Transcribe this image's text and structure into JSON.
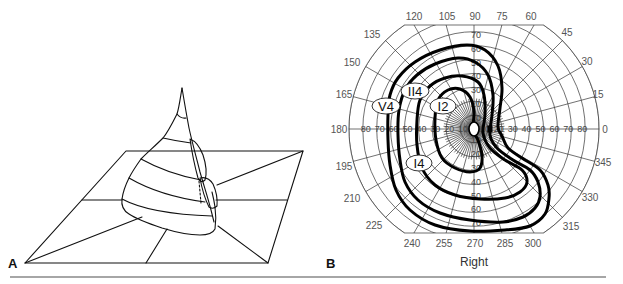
{
  "panels": {
    "a": {
      "letter": "A",
      "letter_pos": [
        8,
        268
      ]
    },
    "b": {
      "letter": "B",
      "letter_pos": [
        326,
        268
      ],
      "eye_label": "Right",
      "eye_label_pos": [
        474,
        266
      ]
    }
  },
  "colors": {
    "line": "#111111",
    "grid": "#333333",
    "label": "#555555",
    "divider": "#888888",
    "background": "#ffffff"
  },
  "divider": {
    "x1": 10,
    "x2": 606,
    "y": 277
  },
  "figure_a": {
    "description": "3D hill of vision over a field plane",
    "plane_outline": [
      [
        25,
        263
      ],
      [
        268,
        263
      ],
      [
        303,
        151
      ],
      [
        126,
        151
      ],
      [
        25,
        263
      ]
    ],
    "plane_lines": [
      [
        [
          146,
          263
        ],
        [
          167,
          229
        ]
      ],
      [
        [
          82,
          200
        ],
        [
          122,
          200
        ]
      ],
      [
        [
          216,
          200
        ],
        [
          287,
          200
        ]
      ],
      [
        [
          25,
          263
        ],
        [
          142,
          217
        ]
      ],
      [
        [
          303,
          151
        ],
        [
          217,
          185
        ]
      ],
      [
        [
          268,
          263
        ],
        [
          218,
          226
        ]
      ]
    ],
    "hill_outline": "M182,88 C180,100 179,108 177,114 C172,124 168,132 163,138 C155,146 148,152 141,159 C136,166 132,172 129,178 C125,186 123,192 122,199 C121,206 124,211 129,214 C138,220 150,224 162,228 C175,232 188,235 200,235 C208,235 213,233 215,229 C216,222 216,214 215,207 C214,200 213,196 212,192",
    "hill_ridge": "M182,88 C184,100 186,112 189,128 C192,142 196,156 200,172 C204,186 208,198 211,210 C212,214 213,218 214,222",
    "hill_bands": [
      "M177,114 Q181,119 186,118",
      "M163,138 Q176,141 191,143",
      "M141,159 Q168,174 201,180",
      "M129,178 Q160,196 205,202",
      "M122,199 Q150,214 212,216"
    ],
    "hill_lobes": [
      "M190,139 Q198,142 203,155 Q208,170 205,180 Q201,184 198,178 Q193,160 190,139",
      "M200,178 Q208,176 213,184 Q218,195 217,206 Q213,210 209,207 Q203,195 200,178"
    ],
    "hill_dashed": "M199,181 L201,203"
  },
  "chart_data": {
    "type": "polar",
    "subtitle": "Right",
    "angular_ticks_deg": [
      0,
      15,
      30,
      45,
      60,
      75,
      90,
      105,
      120,
      135,
      150,
      165,
      180,
      195,
      210,
      225,
      240,
      255,
      270,
      285,
      300,
      315,
      330,
      345
    ],
    "radial_ticks_deg": [
      10,
      20,
      30,
      40,
      50,
      60,
      70,
      80,
      90
    ],
    "radial_tick_labels": [
      "10",
      "20",
      "30",
      "40",
      "50",
      "60",
      "70",
      "80"
    ],
    "radial_range": [
      0,
      90
    ],
    "grid": true,
    "isopters": [
      {
        "name": "V4",
        "extent_deg": {
          "0": 17,
          "90": 61,
          "180": 64,
          "270": 74,
          "315": 74
        }
      },
      {
        "name": "II4",
        "extent_deg": {
          "0": 11,
          "90": 52,
          "180": 56,
          "270": 68,
          "315": 65
        }
      },
      {
        "name": "I4",
        "extent_deg": {
          "0": 6,
          "90": 39,
          "180": 42,
          "270": 51,
          "315": 50
        }
      },
      {
        "name": "I2",
        "extent_deg": {
          "0": 1,
          "90": 29,
          "180": 29,
          "270": 31,
          "315": 25
        }
      }
    ],
    "blind_spot": {
      "angle_deg": 0,
      "eccentricity_deg": 12
    }
  },
  "figure_b": {
    "center": [
      474,
      129
    ],
    "px_per_10deg": 13.9,
    "clip_top_y": 25,
    "clip_bottom_y": 233,
    "angle_labels": [
      {
        "t": "0",
        "x": 605,
        "y": 133
      },
      {
        "t": "15",
        "x": 598,
        "y": 98
      },
      {
        "t": "30",
        "x": 587,
        "y": 65
      },
      {
        "t": "45",
        "x": 567,
        "y": 36
      },
      {
        "t": "60",
        "x": 531,
        "y": 20
      },
      {
        "t": "75",
        "x": 502,
        "y": 20
      },
      {
        "t": "90",
        "x": 475,
        "y": 20
      },
      {
        "t": "105",
        "x": 447,
        "y": 20
      },
      {
        "t": "120",
        "x": 414,
        "y": 20
      },
      {
        "t": "135",
        "x": 372,
        "y": 38
      },
      {
        "t": "150",
        "x": 352,
        "y": 66
      },
      {
        "t": "165",
        "x": 344,
        "y": 98
      },
      {
        "t": "180",
        "x": 339,
        "y": 133
      },
      {
        "t": "195",
        "x": 344,
        "y": 170
      },
      {
        "t": "210",
        "x": 352,
        "y": 202
      },
      {
        "t": "225",
        "x": 374,
        "y": 229
      },
      {
        "t": "240",
        "x": 412,
        "y": 247
      },
      {
        "t": "255",
        "x": 444,
        "y": 247
      },
      {
        "t": "270",
        "x": 475,
        "y": 247
      },
      {
        "t": "285",
        "x": 505,
        "y": 247
      },
      {
        "t": "300",
        "x": 533,
        "y": 247
      },
      {
        "t": "315",
        "x": 571,
        "y": 230
      },
      {
        "t": "330",
        "x": 590,
        "y": 201
      },
      {
        "t": "345",
        "x": 603,
        "y": 166
      }
    ],
    "isopter_paths": [
      {
        "name": "V4",
        "points": [
          [
            498,
            127
          ],
          [
            500,
            108
          ],
          [
            502,
            88
          ],
          [
            498,
            66
          ],
          [
            485,
            50
          ],
          [
            467,
            45
          ],
          [
            440,
            50
          ],
          [
            415,
            62
          ],
          [
            398,
            78
          ],
          [
            390,
            95
          ],
          [
            388,
            115
          ],
          [
            388,
            140
          ],
          [
            390,
            165
          ],
          [
            396,
            190
          ],
          [
            410,
            210
          ],
          [
            435,
            225
          ],
          [
            470,
            231
          ],
          [
            505,
            230
          ],
          [
            530,
            226
          ],
          [
            545,
            214
          ],
          [
            549,
            198
          ],
          [
            548,
            185
          ],
          [
            540,
            170
          ],
          [
            522,
            158
          ],
          [
            508,
            148
          ],
          [
            502,
            136
          ]
        ]
      },
      {
        "name": "II4",
        "points": [
          [
            490,
            135
          ],
          [
            492,
            115
          ],
          [
            493,
            95
          ],
          [
            488,
            75
          ],
          [
            475,
            62
          ],
          [
            458,
            58
          ],
          [
            435,
            64
          ],
          [
            417,
            75
          ],
          [
            405,
            90
          ],
          [
            399,
            110
          ],
          [
            398,
            135
          ],
          [
            400,
            160
          ],
          [
            405,
            182
          ],
          [
            418,
            200
          ],
          [
            440,
            213
          ],
          [
            470,
            220
          ],
          [
            503,
            222
          ],
          [
            523,
            217
          ],
          [
            535,
            208
          ],
          [
            540,
            197
          ],
          [
            538,
            182
          ],
          [
            530,
            170
          ],
          [
            513,
            160
          ],
          [
            497,
            148
          ]
        ]
      },
      {
        "name": "I4",
        "points": [
          [
            483,
            133
          ],
          [
            485,
            115
          ],
          [
            484,
            95
          ],
          [
            478,
            82
          ],
          [
            462,
            76
          ],
          [
            445,
            78
          ],
          [
            430,
            86
          ],
          [
            420,
            100
          ],
          [
            417,
            120
          ],
          [
            417,
            145
          ],
          [
            422,
            168
          ],
          [
            435,
            185
          ],
          [
            455,
            195
          ],
          [
            480,
            199
          ],
          [
            505,
            198
          ],
          [
            520,
            192
          ],
          [
            527,
            182
          ],
          [
            522,
            170
          ],
          [
            505,
            160
          ],
          [
            490,
            148
          ]
        ]
      },
      {
        "name": "I2",
        "points": [
          [
            473,
            130
          ],
          [
            474,
            112
          ],
          [
            470,
            97
          ],
          [
            460,
            89
          ],
          [
            448,
            90
          ],
          [
            438,
            100
          ],
          [
            435,
            118
          ],
          [
            436,
            140
          ],
          [
            442,
            158
          ],
          [
            455,
            168
          ],
          [
            470,
            172
          ],
          [
            480,
            168
          ],
          [
            482,
            155
          ],
          [
            478,
            140
          ]
        ]
      }
    ],
    "isopter_labels": [
      {
        "t": "V4",
        "x": 386,
        "y": 106,
        "rx": 14,
        "ry": 8
      },
      {
        "t": "II4",
        "x": 415,
        "y": 91,
        "rx": 14,
        "ry": 8
      },
      {
        "t": "I2",
        "x": 443,
        "y": 106,
        "rx": 13,
        "ry": 8
      },
      {
        "t": "I4",
        "x": 419,
        "y": 163,
        "rx": 13,
        "ry": 8
      }
    ],
    "fixation_oval": {
      "x": 474,
      "y": 129,
      "rx": 5,
      "ry": 7
    },
    "blind_spot_px": {
      "x": 490,
      "y": 129,
      "w": 5,
      "h": 7
    }
  }
}
